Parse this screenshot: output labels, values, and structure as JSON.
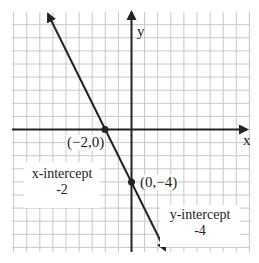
{
  "chart_data": {
    "type": "line",
    "title": "",
    "xlabel": "x",
    "ylabel": "y",
    "grid": true,
    "xlim": [
      -9,
      9
    ],
    "ylim": [
      -9,
      9
    ],
    "series": [
      {
        "name": "line",
        "equation": "y = -2x - 4",
        "x": [
          -6.5,
          2.6
        ],
        "y": [
          9,
          -9.2
        ]
      }
    ],
    "points": [
      {
        "x": -2,
        "y": 0,
        "label": "(−2, 0)"
      },
      {
        "x": 0,
        "y": -4,
        "label": "(0, −4)"
      }
    ],
    "annotations": [
      {
        "text": "x-intercept",
        "value": "-2"
      },
      {
        "text": "y-intercept",
        "value": "-4"
      }
    ]
  },
  "labels": {
    "x_axis": "x",
    "y_axis": "y",
    "point_x_intercept": "(−2,0)",
    "point_y_intercept": "(0,−4)",
    "x_intercept_title": "x-intercept",
    "x_intercept_value": "-2",
    "y_intercept_title": "y-intercept",
    "y_intercept_value": "-4"
  },
  "colors": {
    "grid": "#c8c8c8",
    "axis": "#222222",
    "line": "#222222"
  }
}
